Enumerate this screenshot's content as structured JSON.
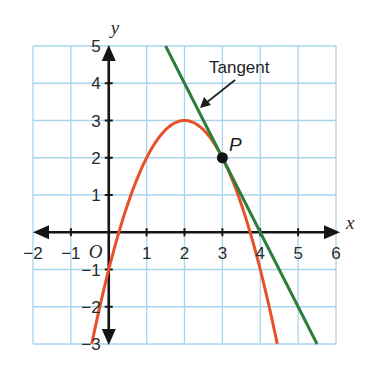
{
  "chart_data": {
    "type": "line",
    "title": "",
    "xlabel": "x",
    "ylabel": "y",
    "origin_label": "O",
    "xlim": [
      -2,
      6
    ],
    "ylim": [
      -3,
      5
    ],
    "grid": true,
    "x_ticks": [
      {
        "value": -2,
        "label": "−2"
      },
      {
        "value": -1,
        "label": "−1"
      },
      {
        "value": 1,
        "label": "1"
      },
      {
        "value": 2,
        "label": "2"
      },
      {
        "value": 3,
        "label": "3"
      },
      {
        "value": 4,
        "label": "4"
      },
      {
        "value": 5,
        "label": "5"
      },
      {
        "value": 6,
        "label": "6"
      }
    ],
    "y_ticks": [
      {
        "value": -3,
        "label": "−3"
      },
      {
        "value": -2,
        "label": "−2"
      },
      {
        "value": -1,
        "label": "−1"
      },
      {
        "value": 1,
        "label": "1"
      },
      {
        "value": 2,
        "label": "2"
      },
      {
        "value": 3,
        "label": "3"
      },
      {
        "value": 4,
        "label": "4"
      },
      {
        "value": 5,
        "label": "5"
      }
    ],
    "series": [
      {
        "name": "curve",
        "kind": "parabola",
        "equation": "y = -x^2 + 4x - 1",
        "coefficients": {
          "a": -1,
          "b": 4,
          "c": -1
        },
        "x_range": [
          -0.449,
          4.449
        ],
        "color": "#e8502a",
        "sample_points": [
          [
            -0.449,
            -3
          ],
          [
            0,
            -1
          ],
          [
            1,
            2
          ],
          [
            2,
            3
          ],
          [
            3,
            2
          ],
          [
            4,
            -1
          ],
          [
            4.449,
            -3
          ]
        ]
      },
      {
        "name": "Tangent",
        "kind": "line",
        "equation": "y = -2x + 8",
        "slope": -2,
        "intercept": 8,
        "x_range": [
          1.5,
          5.5
        ],
        "color": "#2e7d3a",
        "sample_points": [
          [
            1.5,
            5
          ],
          [
            3,
            2
          ],
          [
            4,
            0
          ],
          [
            5.5,
            -3
          ]
        ]
      }
    ],
    "points": [
      {
        "name": "P",
        "x": 3,
        "y": 2,
        "label": "P",
        "color": "#111111"
      }
    ],
    "annotations": [
      {
        "text": "Tangent",
        "points_to": "tangent line",
        "arrow": true
      }
    ],
    "colors": {
      "grid": "#a9d4ec",
      "axis": "#151515"
    }
  }
}
